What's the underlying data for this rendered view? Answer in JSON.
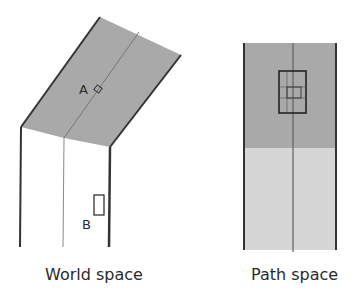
{
  "diagram": {
    "world_space": {
      "caption": "World space",
      "point_a_label": "A",
      "point_b_label": "B",
      "colors": {
        "surface_fill": "#a9a9a9",
        "edge": "#333333",
        "center_line": "#777777"
      }
    },
    "path_space": {
      "caption": "Path space",
      "colors": {
        "upper_fill": "#a9a9a9",
        "lower_fill": "#d6d6d6",
        "edge": "#333333",
        "center_line": "#666666"
      }
    }
  }
}
